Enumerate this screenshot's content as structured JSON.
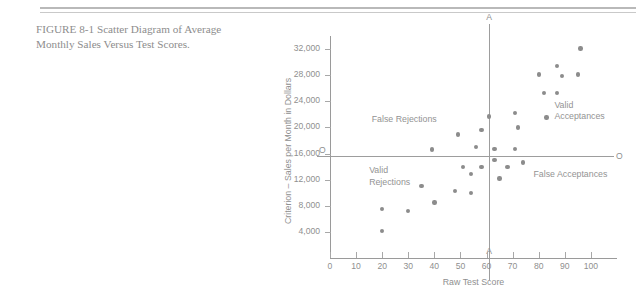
{
  "caption": {
    "line1": "FIGURE  8-1  Scatter  Diagram  of  Average",
    "line2": "Monthly Sales Versus Test Scores."
  },
  "figure": {
    "cut_score_label_top": "A",
    "cut_score_label_bottom": "A",
    "criterion_label_left": "O",
    "criterion_label_right": "O",
    "quadrants": {
      "upper_left": "False Rejections",
      "upper_right": "Valid\nAcceptances",
      "lower_left": "Valid\nRejections",
      "lower_right": "False Acceptances"
    }
  },
  "chart_data": {
    "type": "scatter",
    "title": "Scatter Diagram of Average Monthly Sales Versus Test Scores",
    "xlabel": "Raw Test Score",
    "ylabel": "Criterion – Sales per Month in Dollars",
    "xlim": [
      0,
      110
    ],
    "ylim": [
      0,
      34000
    ],
    "xticks": [
      0,
      10,
      20,
      30,
      40,
      50,
      60,
      70,
      80,
      90,
      100
    ],
    "xtick_labels": [
      "0",
      "10",
      "20",
      "30",
      "40",
      "50",
      "60",
      "70",
      "80",
      "90",
      "100"
    ],
    "yticks": [
      4000,
      8000,
      12000,
      16000,
      20000,
      24000,
      28000,
      32000
    ],
    "ytick_labels": [
      "4,000",
      "8,000",
      "12,000",
      "16,000",
      "20,000",
      "24,000",
      "28,000",
      "32,000"
    ],
    "grid": false,
    "legend": null,
    "reference_lines": [
      {
        "name": "cut-score",
        "orientation": "vertical",
        "x": 61,
        "label": "A"
      },
      {
        "name": "criterion-cutoff",
        "orientation": "horizontal",
        "y": 15600,
        "label": "O"
      }
    ],
    "marker_color": "#8c8c8c",
    "points": [
      {
        "x": 20,
        "y": 7500
      },
      {
        "x": 20,
        "y": 4100
      },
      {
        "x": 30,
        "y": 7200
      },
      {
        "x": 35,
        "y": 11000
      },
      {
        "x": 39,
        "y": 16600
      },
      {
        "x": 40,
        "y": 8500
      },
      {
        "x": 48,
        "y": 10300
      },
      {
        "x": 49,
        "y": 18900
      },
      {
        "x": 51,
        "y": 13900
      },
      {
        "x": 54,
        "y": 12900
      },
      {
        "x": 54,
        "y": 10000
      },
      {
        "x": 56,
        "y": 17000
      },
      {
        "x": 58,
        "y": 19600
      },
      {
        "x": 58,
        "y": 13900
      },
      {
        "x": 61,
        "y": 21700
      },
      {
        "x": 63,
        "y": 16700
      },
      {
        "x": 63,
        "y": 15000
      },
      {
        "x": 65,
        "y": 12200
      },
      {
        "x": 68,
        "y": 13900
      },
      {
        "x": 71,
        "y": 22200
      },
      {
        "x": 71,
        "y": 16700
      },
      {
        "x": 72,
        "y": 20000
      },
      {
        "x": 74,
        "y": 14600
      },
      {
        "x": 80,
        "y": 28100
      },
      {
        "x": 82,
        "y": 25300
      },
      {
        "x": 83,
        "y": 21500
      },
      {
        "x": 87,
        "y": 29400
      },
      {
        "x": 87,
        "y": 25300
      },
      {
        "x": 89,
        "y": 27900
      },
      {
        "x": 95,
        "y": 28100
      },
      {
        "x": 96,
        "y": 32100
      }
    ]
  }
}
